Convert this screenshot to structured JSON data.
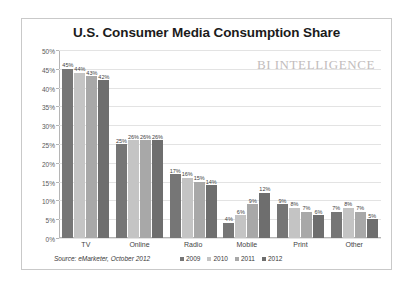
{
  "chart_data": {
    "type": "bar",
    "title": "U.S. Consumer Media Consumption Share",
    "xlabel": "",
    "ylabel": "",
    "ylim": [
      0,
      50
    ],
    "ytick_labels": [
      "0%",
      "5%",
      "10%",
      "15%",
      "20%",
      "25%",
      "30%",
      "35%",
      "40%",
      "45%",
      "50%"
    ],
    "ytick_values": [
      0,
      5,
      10,
      15,
      20,
      25,
      30,
      35,
      40,
      45,
      50
    ],
    "grid": true,
    "legend_position": "bottom",
    "value_label_suffix": "%",
    "categories": [
      "TV",
      "Online",
      "Radio",
      "Mobile",
      "Print",
      "Other"
    ],
    "series": [
      {
        "name": "2009",
        "color": "#767676",
        "values": [
          45,
          25,
          17,
          4,
          9,
          7
        ]
      },
      {
        "name": "2010",
        "color": "#c4c4c4",
        "values": [
          44,
          26,
          16,
          6,
          8,
          8
        ]
      },
      {
        "name": "2011",
        "color": "#a8a8a8",
        "values": [
          43,
          26,
          15,
          9,
          7,
          7
        ]
      },
      {
        "name": "2012",
        "color": "#6e6e6e",
        "values": [
          42,
          26,
          14,
          12,
          6,
          5
        ]
      }
    ],
    "source_note": "Source: eMarketer, October 2012",
    "watermark": {
      "prefix": "BI",
      "name": "INTELLIGENCE"
    }
  }
}
